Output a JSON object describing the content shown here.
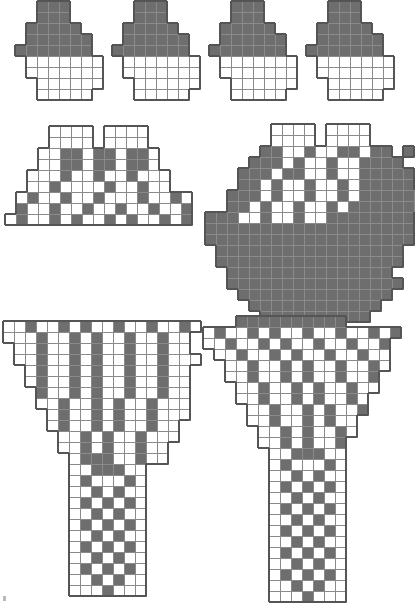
{
  "document": {
    "title": "Cross-stitch pattern chart sheet",
    "page_width": 411,
    "page_height": 605,
    "cell_size": 11,
    "colors": {
      "filled": "#6e6e6e",
      "empty": "#ffffff",
      "grid_line": "#8a8a8a",
      "outline": "#555555",
      "background": "#ffffff",
      "corner_mark": "#b9b9b9"
    }
  },
  "charts": [
    {
      "name": "top-motif-1",
      "x": 14,
      "y": 0,
      "cols": 9,
      "rows": 9,
      "note": "small stepped pyramid motif, solid filled top, open lower body",
      "grid": [
        "..111....",
        "..111....",
        ".11111...",
        ".111111..",
        "1111111..",
        ".0000000.",
        ".0000000.",
        "..000000.",
        "..00000.."
      ]
    },
    {
      "name": "top-motif-2",
      "x": 111,
      "y": 0,
      "cols": 9,
      "rows": 9,
      "note": "small stepped pyramid motif, solid filled top, open lower body",
      "grid": [
        "..111....",
        "..111....",
        ".11111...",
        ".111111..",
        "1111111..",
        ".0000000.",
        ".0000000.",
        "..000000.",
        "..00000.."
      ]
    },
    {
      "name": "top-motif-3",
      "x": 208,
      "y": 0,
      "cols": 9,
      "rows": 9,
      "note": "small stepped pyramid motif, solid filled top, open lower body",
      "grid": [
        "..111....",
        "..111....",
        ".11111...",
        ".111111..",
        "1111111..",
        ".0000000.",
        ".0000000.",
        "..000000.",
        "..00000.."
      ]
    },
    {
      "name": "top-motif-4",
      "x": 305,
      "y": 0,
      "cols": 9,
      "rows": 9,
      "note": "small stepped pyramid motif, solid filled top, open lower body",
      "grid": [
        "..111....",
        "..111....",
        ".11111...",
        ".111111..",
        "1111111..",
        ".0000000.",
        ".0000000.",
        "..000000.",
        "..00000.."
      ]
    },
    {
      "name": "mid-left-motif",
      "x": 4,
      "y": 125,
      "cols": 17,
      "rows": 9,
      "note": "wide stepped trapezoid, symmetric lattice / chevron design",
      "grid": [
        "....0000.0000....",
        "....0000.0000....",
        "...00110110110...",
        "...00110110110...",
        "..0001001001000..",
        "..0010000100100..",
        ".0100100100010010",
        ".1001001001001001",
        "01001010010100101"
      ]
    },
    {
      "name": "mid-right-motif",
      "x": 204,
      "y": 123,
      "cols": 19,
      "rows": 18,
      "note": "large round shield / bowl shape, heavily filled, open chevron band at top",
      "grid": [
        "......0000.0000....",
        "......0000.0000....",
        ".....110010011011.1",
        "....11101001001111.",
        "...1110110010011111",
        "...1101001001011111",
        "..111010010010111111",
        "..110100100101111111",
        "1110010010011111111",
        "1111111111111111111",
        "1111111111111111111",
        ".11111111111111111.",
        ".11111111111111111.",
        "..111111111111111..",
        "..1111111111111111.",
        "...11111111111111..",
        "....111111111111...",
        ".....1111111111...."
      ]
    },
    {
      "name": "bottom-left-motif",
      "x": 2,
      "y": 320,
      "cols": 18,
      "rows": 25,
      "note": "inverted triangle yoke above a long narrow vertical band / column",
      "grid": [
        "001001010010010010",
        "00010010100100100.",
        ".0010010100100100.",
        ".00100101001001000",
        "..010010100100100.",
        "..010010100100100.",
        "...10010100100100.",
        "...00100101001000.",
        "....0100101001000.",
        "....010010100100..",
        ".....00101001000..",
        ".....0010100100...",
        "......011100100...",
        "......0011100.....",
        "......0100010.....",
        "......0010100.....",
        "......0101010.....",
        "......0010100.....",
        "......0101010.....",
        "......0010100.....",
        "......0101010.....",
        "......0010100.....",
        "......0101010.....",
        "......0010100.....",
        "......0001000....."
      ]
    },
    {
      "name": "bottom-right-motif",
      "x": 202,
      "y": 315,
      "cols": 19,
      "rows": 26,
      "note": "inverted triangle yoke above a long narrow vertical band / column",
      "grid": [
        "...1111111111......",
        "010010100100100101.",
        "00100101001001001..",
        ".0010010100100100..",
        "..001001010010010.",
        "..00100101001001..",
        "...0010010100100..",
        "...001001010010...",
        "....00100101001...",
        "....0010010100....",
        ".....001010010....",
        ".....00101001.....",
        "......0011100.....",
        "......0100010.....",
        "......0010100.....",
        "......0101010.....",
        "......0010100.....",
        "......0101010.....",
        "......0010100.....",
        "......0101010.....",
        "......0010100.....",
        "......0101010.....",
        "......0010100.....",
        "......0101010.....",
        "......0010100.....",
        "......0001000....."
      ]
    }
  ],
  "corner_mark": {
    "name": "registration-mark",
    "visible": true
  }
}
